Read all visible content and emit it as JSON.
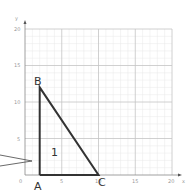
{
  "diagram": {
    "axes": {
      "x_label": "x",
      "y_label": "y",
      "x_ticks": [
        "0",
        "5",
        "10",
        "15",
        "20"
      ],
      "y_ticks": [
        "5",
        "10",
        "15",
        "20"
      ],
      "range": [
        0,
        20
      ]
    },
    "points": {
      "A": {
        "label": "A",
        "x": 2,
        "y": 0
      },
      "B": {
        "label": "B",
        "x": 2,
        "y": 12
      },
      "C": {
        "label": "C",
        "x": 10,
        "y": 0
      }
    },
    "region_label": "1",
    "colors": {
      "grid_minor": "#e6e6e6",
      "grid_major": "#c8c8c8",
      "shape": "#333333",
      "tick": "#999999"
    }
  }
}
